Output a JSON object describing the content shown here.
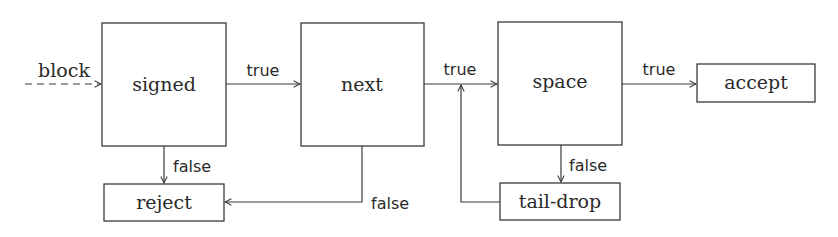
{
  "diagram": {
    "type": "flowchart",
    "input_label": "block",
    "nodes": [
      {
        "id": "signed",
        "label": "signed"
      },
      {
        "id": "next",
        "label": "next"
      },
      {
        "id": "space",
        "label": "space"
      },
      {
        "id": "accept",
        "label": "accept"
      },
      {
        "id": "reject",
        "label": "reject"
      },
      {
        "id": "tail-drop",
        "label": "tail-drop"
      }
    ],
    "edges": [
      {
        "from": "input",
        "to": "signed",
        "label": "block",
        "style": "dashed"
      },
      {
        "from": "signed",
        "to": "next",
        "label": "true"
      },
      {
        "from": "signed",
        "to": "reject",
        "label": "false"
      },
      {
        "from": "next",
        "to": "space",
        "label": "true"
      },
      {
        "from": "next",
        "to": "reject",
        "label": "false"
      },
      {
        "from": "space",
        "to": "accept",
        "label": "true"
      },
      {
        "from": "space",
        "to": "tail-drop",
        "label": "false"
      },
      {
        "from": "tail-drop",
        "to": "next-space-edge",
        "label": ""
      }
    ],
    "labels": {
      "block": "block",
      "signed_true": "true",
      "signed_false": "false",
      "next_true": "true",
      "next_false": "false",
      "space_true": "true",
      "space_false": "false"
    },
    "colors": {
      "stroke": "#3a3a3a",
      "text": "#2a2a2a",
      "background": "#ffffff"
    }
  }
}
